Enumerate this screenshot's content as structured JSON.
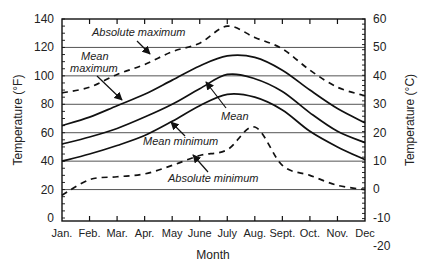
{
  "chart_data": {
    "type": "line",
    "title": "",
    "xlabel": "Month",
    "ylabel": "Temperature (°F)",
    "ylabel_right": "Temperature (°C)",
    "categories": [
      "Jan.",
      "Feb.",
      "Mar.",
      "Apr.",
      "May",
      "June",
      "July",
      "Aug.",
      "Sept.",
      "Oct.",
      "Nov.",
      "Dec"
    ],
    "ylim": [
      0,
      140
    ],
    "yticks": [
      0,
      20,
      40,
      60,
      80,
      100,
      120,
      140
    ],
    "ylim_right": [
      -20,
      60
    ],
    "yticks_right": [
      -20,
      -10,
      0,
      10,
      20,
      30,
      40,
      50,
      60
    ],
    "grid": "horizontal at 20°F intervals",
    "series": [
      {
        "name": "Absolute maximum",
        "style": "dashed",
        "values": [
          88,
          92,
          101,
          108,
          117,
          123,
          135,
          127,
          119,
          104,
          92,
          86
        ]
      },
      {
        "name": "Mean maximum",
        "style": "solid",
        "values": [
          65,
          71,
          79,
          87,
          97,
          107,
          114,
          113,
          104,
          90,
          77,
          67
        ]
      },
      {
        "name": "Mean",
        "style": "solid",
        "values": [
          52,
          57,
          63,
          71,
          80,
          91,
          101,
          98,
          89,
          74,
          61,
          53
        ]
      },
      {
        "name": "Mean minimum",
        "style": "solid",
        "values": [
          40,
          45,
          51,
          58,
          68,
          79,
          87,
          85,
          76,
          61,
          50,
          41
        ]
      },
      {
        "name": "Absolute minimum",
        "style": "dashed",
        "values": [
          16,
          27,
          29,
          31,
          37,
          44,
          48,
          64,
          37,
          30,
          23,
          20
        ]
      }
    ],
    "annotations": [
      {
        "text": "Absolute maximum",
        "target": "Absolute maximum"
      },
      {
        "text": "Mean maximum",
        "lines": [
          "Mean",
          "maximum"
        ],
        "target": "Mean maximum"
      },
      {
        "text": "Mean",
        "target": "Mean"
      },
      {
        "text": "Mean minimum",
        "target": "Mean minimum"
      },
      {
        "text": "Absolute minimum",
        "target": "Absolute minimum"
      }
    ]
  },
  "labels": {
    "xlabel": "Month",
    "ylabel_left": "Temperature (°F)",
    "ylabel_right": "Temperature (°C)",
    "ann_abs_max": "Absolute maximum",
    "ann_mean_max_1": "Mean",
    "ann_mean_max_2": "maximum",
    "ann_mean": "Mean",
    "ann_mean_min": "Mean minimum",
    "ann_abs_min": "Absolute minimum"
  }
}
